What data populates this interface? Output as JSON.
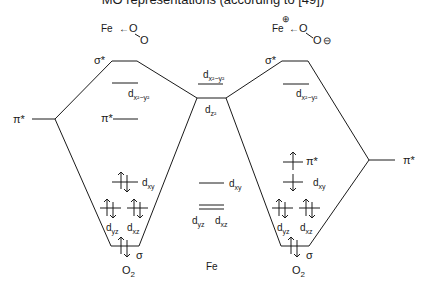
{
  "title": "MO representations (according to [49])",
  "left_structure": {
    "atom": "Fe",
    "arrow": "←",
    "ligand_top": "O",
    "ligand_bottom": "O"
  },
  "right_structure": {
    "atom": "Fe",
    "charge_fe": "⊕",
    "arrow": "←",
    "ligand_top": "O",
    "ligand_bottom": "O",
    "charge_o": "⊖"
  },
  "labels": {
    "pi_star": "π*",
    "sigma_star": "σ*",
    "sigma": "σ",
    "d": "d",
    "sub_x2y2": "x²−y²",
    "sub_z2": "z²",
    "sub_xy": "xy",
    "sub_yz": "yz",
    "sub_xz": "xz",
    "o2": "O",
    "o2_sub": "2",
    "fe": "Fe"
  },
  "levels": {
    "left_complex": [
      "σ*",
      "d x²−y²",
      "π*",
      "d xy (↑↓)",
      "d yz (↑↓)",
      "d xz (↑↓)",
      "σ (↑↓)"
    ],
    "fe_center": [
      "d x²−y²",
      "d z²",
      "d xy",
      "d yz",
      "d xz"
    ],
    "right_complex": [
      "σ*",
      "d x²−y²",
      "π* (↑)",
      "d xy (↓)",
      "d yz (↑↓)",
      "d xz (↑↓)",
      "σ (↑↓)"
    ]
  }
}
